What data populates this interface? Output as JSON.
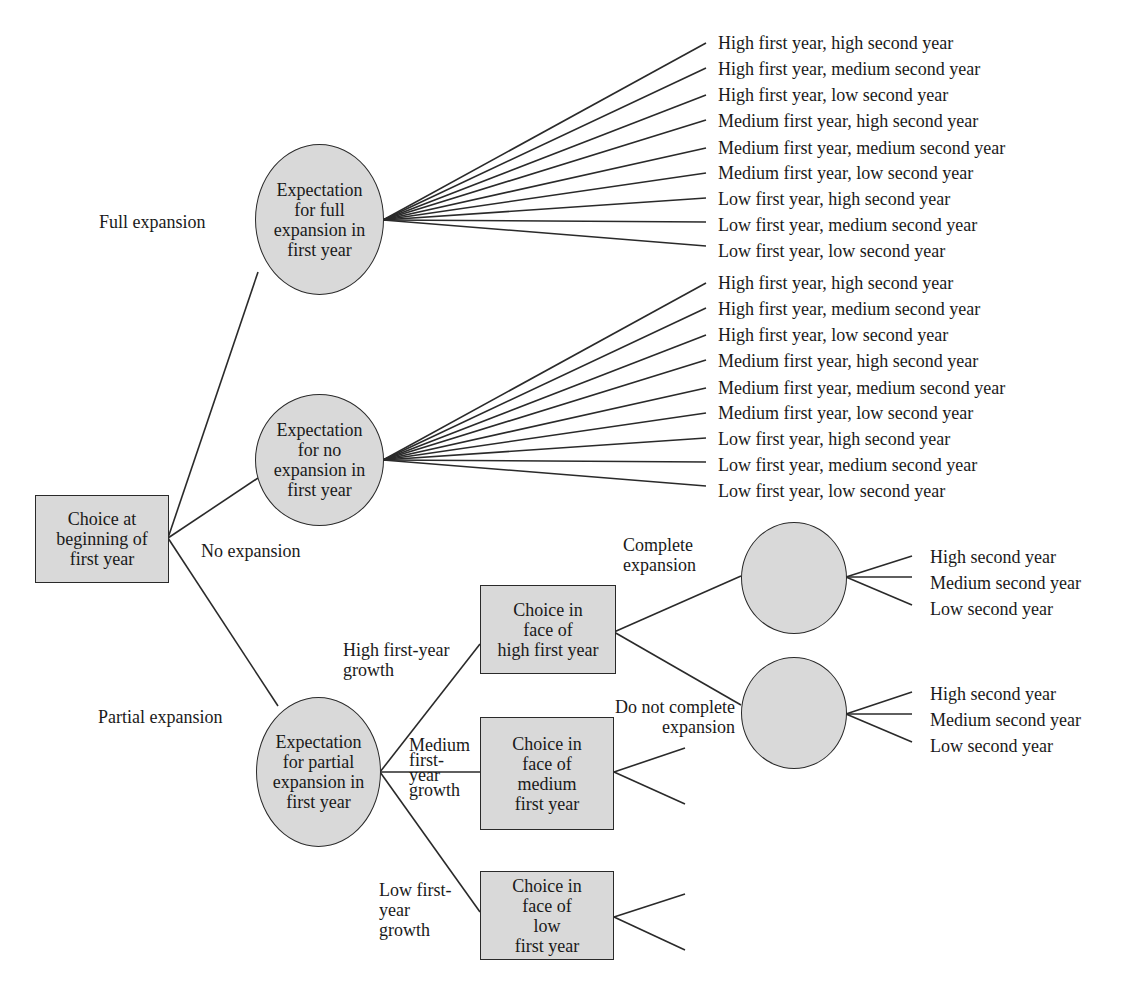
{
  "diagram": {
    "type": "decision-tree",
    "root": {
      "label": "Choice at\nbeginning of\nfirst year",
      "shape": "rectangle",
      "branches": [
        {
          "label": "Full expansion"
        },
        {
          "label": "No expansion"
        },
        {
          "label": "Partial expansion"
        }
      ]
    },
    "chance_nodes": {
      "full": {
        "label": "Expectation\nfor full\nexpansion in\nfirst year"
      },
      "none": {
        "label": "Expectation\nfor no\nexpansion in\nfirst year"
      },
      "partial": {
        "label": "Expectation\nfor partial\nexpansion in\nfirst year"
      },
      "complete": {
        "label": ""
      },
      "not_complete": {
        "label": ""
      }
    },
    "full_outcomes": [
      "High first year, high second year",
      "High first year, medium second year",
      "High first year, low second year",
      "Medium first year, high second year",
      "Medium first year, medium second year",
      "Medium first year, low second year",
      "Low first year, high second year",
      "Low first year, medium second year",
      "Low first year, low second year"
    ],
    "none_outcomes": [
      "High first year, high second year",
      "High first year, medium second year",
      "High first year, low second year",
      "Medium first year, high second year",
      "Medium first year, medium second year",
      "Medium first year, low second year",
      "Low first year, high second year",
      "Low first year, medium second year",
      "Low first year, low second year"
    ],
    "growth_branches": {
      "high": "High first-year\ngrowth",
      "medium": "Medium\nfirst-\nyear\ngrowth",
      "low": "Low first-\nyear\ngrowth"
    },
    "decision_nodes": {
      "high": "Choice in\nface of\nhigh first year",
      "medium": "Choice in\nface of\nmedium\nfirst year",
      "low": "Choice in\nface of\nlow\nfirst year"
    },
    "second_choice_branches": {
      "complete": "Complete\nexpansion",
      "not_complete": "Do not complete\nexpansion"
    },
    "complete_outcomes": [
      "High second year",
      "Medium second year",
      "Low second year"
    ],
    "not_complete_outcomes": [
      "High second year",
      "Medium second year",
      "Low second year"
    ],
    "colors": {
      "node_fill": "#d9d9d9",
      "stroke": "#2a2a2a",
      "text": "#1a1a1a"
    }
  }
}
